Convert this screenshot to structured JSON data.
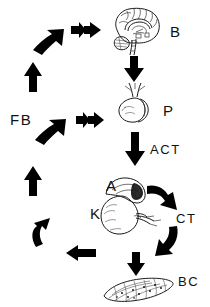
{
  "figure": {
    "background_color": "#ffffff",
    "ink_color": "#000000",
    "width": 210,
    "height": 307
  },
  "nodes": [
    {
      "id": "brain",
      "label": "B",
      "icon": "brain-sagittal-icon",
      "meaning": "Brain"
    },
    {
      "id": "pituitary",
      "label": "P",
      "icon": "pituitary-gland-icon",
      "meaning": "Pituitary"
    },
    {
      "id": "adrenal",
      "label": "A",
      "icon": "adrenal-gland-icon",
      "meaning": "Adrenal"
    },
    {
      "id": "kidney",
      "label": "K",
      "icon": "kidney-icon",
      "meaning": "Kidney"
    },
    {
      "id": "bodycells",
      "label": "BC",
      "icon": "body-cells-tissue-icon",
      "meaning": "Body cells"
    }
  ],
  "signals": [
    {
      "id": "act",
      "label": "ACT",
      "meaning": "Adrenocorticotropic hormone"
    },
    {
      "id": "ct",
      "label": "CT",
      "meaning": "Corticosteroid"
    },
    {
      "id": "feedback",
      "label": "FB",
      "meaning": "Feedback"
    }
  ],
  "arrows": [
    {
      "id": "brain-to-pituitary",
      "direction": "down",
      "style": "solid-block"
    },
    {
      "id": "pituitary-to-adrenal",
      "direction": "down",
      "style": "solid-block"
    },
    {
      "id": "adrenal-to-ct",
      "direction": "down-right",
      "style": "curved-block"
    },
    {
      "id": "ct-to-bodycells",
      "direction": "down-left",
      "style": "curved-block"
    },
    {
      "id": "ct-down-to-bodycells",
      "direction": "down",
      "style": "solid-block"
    },
    {
      "id": "bodycells-to-left",
      "direction": "left",
      "style": "solid-block"
    },
    {
      "id": "feedback-up-lower",
      "direction": "up-left",
      "style": "curved-block"
    },
    {
      "id": "feedback-up-mid",
      "direction": "up",
      "style": "solid-block"
    },
    {
      "id": "feedback-to-pituitary",
      "direction": "up-right",
      "style": "curved-block"
    },
    {
      "id": "feedback-in-pituitary",
      "direction": "right",
      "style": "double-chevron"
    },
    {
      "id": "feedback-up-top",
      "direction": "up",
      "style": "solid-block"
    },
    {
      "id": "feedback-to-brain",
      "direction": "up-right",
      "style": "curved-block"
    },
    {
      "id": "feedback-in-brain",
      "direction": "right",
      "style": "double-chevron"
    }
  ]
}
